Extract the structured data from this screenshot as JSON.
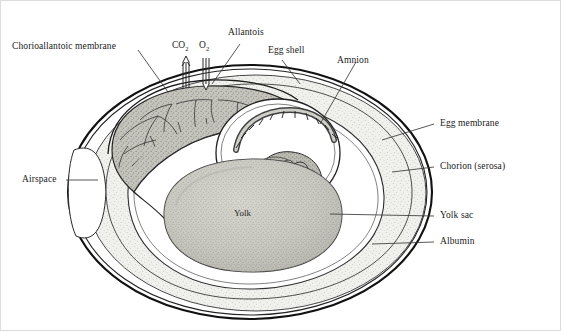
{
  "figure": {
    "background_color": "#ffffff",
    "border_color": "#d8d8d8",
    "ink_color": "#1a1a1a",
    "leader_color": "#3a3a3a"
  },
  "palette": {
    "shell": "#ffffff",
    "shell_outline": "#111111",
    "membrane_outline": "#222222",
    "albumin_fill": "#eeeeea",
    "albumin_stipple": "#9a9a93",
    "yolk_fill": "#c9c9c2",
    "yolk_stipple": "#6e6e66",
    "allantois_fill": "#bdbdb6",
    "cam_vessel": "#2b2b2b",
    "embryo_fill": "#b4b4ad",
    "airspace_fill": "#ffffff"
  },
  "labels": {
    "chorioallantoic_membrane": "Chorioallantoic membrane",
    "allantois": "Allantois",
    "egg_shell": "Egg shell",
    "amnion": "Amnion",
    "egg_membrane": "Egg membrane",
    "chorion": "Chorion (serosa)",
    "yolk_sac": "Yolk sac",
    "albumin": "Albumin",
    "airspace": "Airspace",
    "yolk": "Yolk"
  },
  "gases": {
    "carbon_dioxide": "CO",
    "carbon_dioxide_sub": "2",
    "carbon_dioxide_direction": "out",
    "oxygen": "O",
    "oxygen_sub": "2",
    "oxygen_direction": "in"
  }
}
